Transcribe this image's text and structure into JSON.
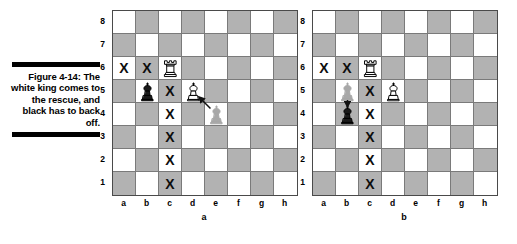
{
  "caption": {
    "figure_label": "Figure 4-14:",
    "text": "The white king comes to the rescue, and black has to back off."
  },
  "boards": [
    {
      "letter": "a",
      "rank_labels": [
        "8",
        "7",
        "6",
        "5",
        "4",
        "3",
        "2",
        "1"
      ],
      "file_labels": [
        "a",
        "b",
        "c",
        "d",
        "e",
        "f",
        "g",
        "h"
      ],
      "pieces": [
        {
          "square": "c6",
          "type": "white-rook",
          "ghost": false
        },
        {
          "square": "b5",
          "type": "black-king",
          "ghost": false
        },
        {
          "square": "d5",
          "type": "white-king",
          "ghost": false
        },
        {
          "square": "e4",
          "type": "white-king",
          "ghost": true
        }
      ],
      "marks": [
        "a6",
        "b6",
        "c5",
        "c4",
        "c3",
        "c2",
        "c1"
      ],
      "arrow": {
        "from": "e4",
        "to": "d5"
      }
    },
    {
      "letter": "b",
      "rank_labels": [
        "8",
        "7",
        "6",
        "5",
        "4",
        "3",
        "2",
        "1"
      ],
      "file_labels": [
        "a",
        "b",
        "c",
        "d",
        "e",
        "f",
        "g",
        "h"
      ],
      "pieces": [
        {
          "square": "c6",
          "type": "white-rook",
          "ghost": false
        },
        {
          "square": "b5",
          "type": "black-king",
          "ghost": true
        },
        {
          "square": "d5",
          "type": "white-king",
          "ghost": false
        },
        {
          "square": "b4",
          "type": "black-king",
          "ghost": false
        }
      ],
      "marks": [
        "a6",
        "b6",
        "c5",
        "c4",
        "c3",
        "c2",
        "c1"
      ],
      "arrow": {
        "from": "b5",
        "to": "b4"
      }
    }
  ],
  "mark_glyph": "X",
  "colors": {
    "light_square": "#ffffff",
    "dark_square": "#b2b2b2",
    "ghost_piece": "#a8a8a8",
    "ink": "#000000"
  }
}
